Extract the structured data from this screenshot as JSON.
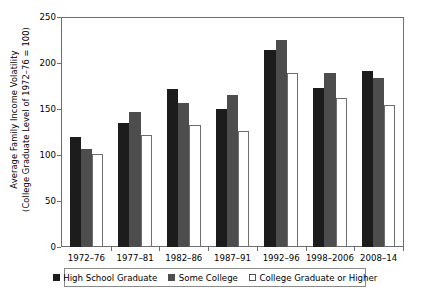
{
  "chart_data": {
    "type": "bar",
    "title": "",
    "xlabel": "",
    "ylabel_line1": "Average Family Income Volatility",
    "ylabel_line2": "(College Graduate Level of 1972–76 = 100)",
    "ylim": [
      0,
      250
    ],
    "yticks": [
      0,
      50,
      100,
      150,
      200,
      250
    ],
    "grid": false,
    "legend_position": "bottom",
    "categories": [
      "1972–76",
      "1977–81",
      "1982–86",
      "1987–91",
      "1992–96",
      "1998–2006",
      "2008–14"
    ],
    "series": [
      {
        "name": "High School Graduate",
        "color": "#1c1c1c",
        "values": [
          120,
          135,
          172,
          150,
          214,
          173,
          191
        ]
      },
      {
        "name": "Some College",
        "color": "#4d4d4d",
        "values": [
          107,
          147,
          157,
          165,
          225,
          189,
          184
        ]
      },
      {
        "name": "College Graduate or Higher",
        "color": "#ffffff",
        "values": [
          101,
          122,
          133,
          126,
          189,
          162,
          154
        ]
      }
    ]
  },
  "legend": {
    "items": [
      {
        "label": "High School Graduate",
        "swatch": "hs"
      },
      {
        "label": "Some College",
        "swatch": "some"
      },
      {
        "label": "College Graduate or Higher",
        "swatch": "college"
      }
    ]
  },
  "colors": {
    "high_school": "#1c1c1c",
    "some_college": "#4d4d4d",
    "college_graduate": "#ffffff",
    "axis": "#6e6e6e"
  }
}
